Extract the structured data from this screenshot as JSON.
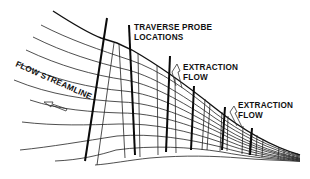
{
  "diagram": {
    "labels": {
      "traverse_line1": "TRAVERSE PROBE",
      "traverse_line2": "LOCATIONS",
      "extraction1_line1": "EXTRACTION",
      "extraction1_line2": "FLOW",
      "extraction2_line1": "EXTRACTION",
      "extraction2_line2": "FLOW",
      "streamline": "FLOW STREAMLINE"
    },
    "elements": {
      "streamline_count": 12,
      "probe_count": 4,
      "extraction_arrows": 2,
      "flow_direction": "left"
    },
    "colors": {
      "ink": "#111111",
      "background": "#ffffff"
    }
  }
}
